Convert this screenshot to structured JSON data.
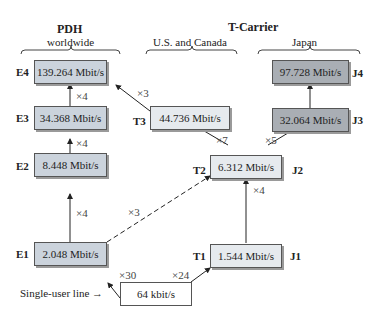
{
  "headers": {
    "pdh": {
      "title": "PDH",
      "subtitle": "worldwide"
    },
    "tcarrier": {
      "title": "T-Carrier"
    },
    "us": {
      "subtitle": "U.S. and Canada"
    },
    "japan": {
      "subtitle": "Japan"
    }
  },
  "nodes": {
    "E4": {
      "label": "E4",
      "rate": "139.264 Mbit/s"
    },
    "E3": {
      "label": "E3",
      "rate": "34.368 Mbit/s"
    },
    "E2": {
      "label": "E2",
      "rate": "8.448 Mbit/s"
    },
    "E1": {
      "label": "E1",
      "rate": "2.048 Mbit/s"
    },
    "T3": {
      "label": "T3",
      "rate": "44.736 Mbit/s"
    },
    "T2": {
      "label": "T2",
      "rate": "6.312 Mbit/s"
    },
    "T1": {
      "label": "T1",
      "rate": "1.544 Mbit/s"
    },
    "J4": {
      "label": "J4",
      "rate": "97.728 Mbit/s"
    },
    "J3": {
      "label": "J3",
      "rate": "32.064 Mbit/s"
    },
    "J2": {
      "label": "J2"
    },
    "J1": {
      "label": "J1"
    },
    "base": {
      "rate": "64 kbit/s"
    }
  },
  "multipliers": {
    "e3_e4": "×4",
    "e2_e3": "×4",
    "e1_e2": "×4",
    "t3_e4": "×3",
    "e1_t2": "×3",
    "t2_t3": "×7",
    "t2_j3": "×5",
    "t1_t2": "×4",
    "base_e1": "×30",
    "base_t1": "×24"
  },
  "single_user": "Single-user line →"
}
